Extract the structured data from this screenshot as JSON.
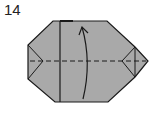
{
  "step_number": "14",
  "colors": {
    "paper": "#a9a9a9",
    "line": "#1a1a1a",
    "background": "#ffffff"
  },
  "diagram": {
    "shape": "octagonal folded paper",
    "fold_line": "valley (dashed) horizontal center",
    "arrow": "curved fold arrow pointing up"
  }
}
